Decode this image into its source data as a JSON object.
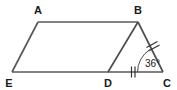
{
  "figure": {
    "stroke_color": "#4d4d4d",
    "mark_color": "#333333",
    "label_color": "#1a1a1a",
    "background_color": "#ffffff",
    "vertices": [
      {
        "id": "A",
        "label": "A",
        "x": 38,
        "y": 22,
        "label_x": 38,
        "label_y": 14
      },
      {
        "id": "B",
        "label": "B",
        "x": 138,
        "y": 22,
        "label_x": 138,
        "label_y": 14
      },
      {
        "id": "C",
        "label": "C",
        "x": 163,
        "y": 72,
        "label_x": 167,
        "label_y": 86
      },
      {
        "id": "D",
        "label": "D",
        "x": 108,
        "y": 72,
        "label_x": 108,
        "label_y": 86
      },
      {
        "id": "E",
        "label": "E",
        "x": 12,
        "y": 72,
        "label_x": 8,
        "label_y": 86
      }
    ],
    "edges": [
      {
        "id": "AB",
        "from": "A",
        "to": "B",
        "x1": 38,
        "y1": 22,
        "x2": 138,
        "y2": 22,
        "width": 1.6
      },
      {
        "id": "AE",
        "from": "A",
        "to": "E",
        "x1": 38,
        "y1": 22,
        "x2": 12,
        "y2": 72,
        "width": 1.6
      },
      {
        "id": "EC",
        "from": "E",
        "to": "C",
        "x1": 12,
        "y1": 72,
        "x2": 163,
        "y2": 72,
        "width": 1.6
      },
      {
        "id": "BD",
        "from": "B",
        "to": "D",
        "x1": 138,
        "y1": 22,
        "x2": 108,
        "y2": 72,
        "width": 1.6
      },
      {
        "id": "BC",
        "from": "B",
        "to": "C",
        "x1": 138,
        "y1": 22,
        "x2": 163,
        "y2": 72,
        "width": 1.6
      }
    ],
    "congruence_marks": [
      {
        "id": "BC-ticks",
        "on_edge": "BC",
        "count": 2,
        "cx": 152,
        "cy": 46
      },
      {
        "id": "DC-ticks",
        "on_edge": "DC",
        "count": 2,
        "cx": 133,
        "cy": 72
      }
    ],
    "angles": [
      {
        "id": "angle-C",
        "at_vertex": "C",
        "value": "36",
        "unit": "°",
        "label": "36°",
        "label_x": 145,
        "label_y": 67
      }
    ]
  }
}
